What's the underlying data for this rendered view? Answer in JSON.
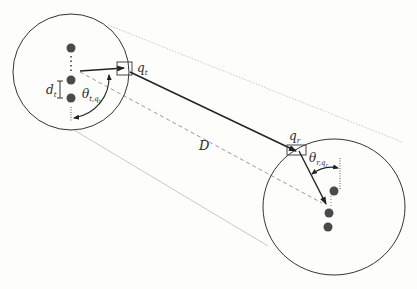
{
  "diagram": {
    "type": "geometry",
    "colors": {
      "stroke": "#333333",
      "node": "#4a4a4a",
      "guide": "#c8c8c8",
      "dashed": "#9a9a9a",
      "background": "#fdfdfc"
    },
    "labels": {
      "q_t": {
        "base": "q",
        "sub": "t"
      },
      "q_r": {
        "base": "q",
        "sub": "r"
      },
      "d_t": {
        "base": "d",
        "sub": "t"
      },
      "theta_t": {
        "base": "θ",
        "sub": "t,q",
        "subsub": "t"
      },
      "theta_r": {
        "base": "θ",
        "sub": "r,q",
        "subsub": "r"
      },
      "distance": "D"
    },
    "transmitter_circle": {
      "center": [
        71,
        72
      ],
      "radius": 58,
      "nodes": [
        [
          71,
          48
        ],
        [
          71,
          80
        ],
        [
          71,
          98
        ]
      ]
    },
    "receiver_circle": {
      "center": [
        334,
        207
      ],
      "radius": 70,
      "nodes": [
        [
          334,
          191
        ],
        [
          329,
          213
        ],
        [
          328,
          227
        ]
      ]
    }
  }
}
